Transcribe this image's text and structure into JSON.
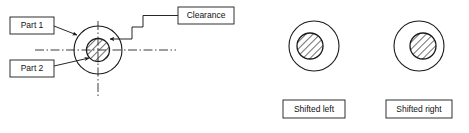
{
  "figure": {
    "title": "",
    "background_color": "#ffffff",
    "stroke_color": "#1a1a1a",
    "hatch_color": "#1a1a1a",
    "label_text_color": "#111111"
  },
  "left_diagram": {
    "name": "clearance-fit-section-view",
    "outer_circle": {
      "cx": 98,
      "cy": 50,
      "r": 24,
      "label": "Part 1"
    },
    "inner_circle": {
      "cx": 98,
      "cy": 50,
      "r": 11.5,
      "label": "Part 2",
      "hatched": true
    },
    "centerline_horizontal": {
      "x1": 35,
      "x2": 176,
      "y": 50
    },
    "centerline_vertical": {
      "y1": 21,
      "y2": 96,
      "x": 98
    }
  },
  "callouts": [
    {
      "id": "part1",
      "label": "Part 1",
      "box": {
        "x": 10,
        "y": 17,
        "w": 44,
        "h": 17
      },
      "leader_kind": "straight-arrow",
      "arrow_target": "outer-circle-upper-left"
    },
    {
      "id": "part2",
      "label": "Part 2",
      "box": {
        "x": 10,
        "y": 60,
        "w": 44,
        "h": 17
      },
      "leader_kind": "straight-arrow",
      "arrow_target": "inner-circle-lower-left"
    },
    {
      "id": "clearance",
      "label": "Clearance",
      "box": {
        "x": 178,
        "y": 7,
        "w": 56,
        "h": 17
      },
      "leader_kind": "stepped-arrow",
      "arrow_target": "inner-circle-upper-right"
    }
  ],
  "right_diagrams": [
    {
      "id": "shifted-left",
      "label": "Shifted left",
      "outer_circle": {
        "cx": 314,
        "cy": 46,
        "r": 25
      },
      "inner_circle": {
        "cx": 310,
        "cy": 46,
        "r": 13,
        "hatched": true
      },
      "box": {
        "x": 283,
        "y": 100,
        "w": 62,
        "h": 18
      }
    },
    {
      "id": "shifted-right",
      "label": "Shifted right",
      "outer_circle": {
        "cx": 419,
        "cy": 46,
        "r": 25
      },
      "inner_circle": {
        "cx": 423,
        "cy": 46,
        "r": 13,
        "hatched": true
      },
      "box": {
        "x": 386,
        "y": 100,
        "w": 66,
        "h": 18
      }
    }
  ]
}
